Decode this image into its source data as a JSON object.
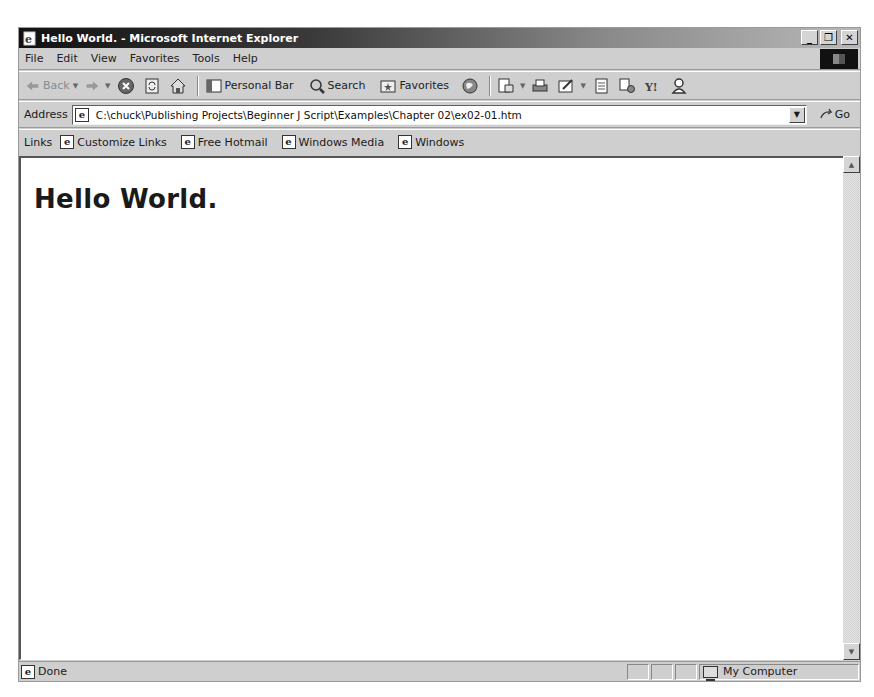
{
  "window": {
    "title": "Hello World. - Microsoft Internet Explorer",
    "controls": {
      "minimize": "_",
      "restore": "❐",
      "close": "✕"
    }
  },
  "menubar": {
    "items": [
      {
        "label": "File",
        "accel": "F"
      },
      {
        "label": "Edit",
        "accel": "E"
      },
      {
        "label": "View",
        "accel": "V"
      },
      {
        "label": "Favorites",
        "accel": "a"
      },
      {
        "label": "Tools",
        "accel": "T"
      },
      {
        "label": "Help",
        "accel": "H"
      }
    ]
  },
  "toolbar": {
    "back_label": "Back",
    "personal_bar_label": "Personal Bar",
    "search_label": "Search",
    "favorites_label": "Favorites",
    "icons": [
      "back-icon",
      "forward-icon",
      "stop-icon",
      "refresh-icon",
      "home-icon",
      "personal-bar-icon",
      "search-icon",
      "favorites-icon",
      "history-icon",
      "mail-icon",
      "print-icon",
      "edit-icon",
      "discuss-icon",
      "messenger-icon",
      "yahoo-icon",
      "user-icon"
    ]
  },
  "address": {
    "label": "Address",
    "value": "C:\\chuck\\Publishing Projects\\Beginner J Script\\Examples\\Chapter 02\\ex02-01.htm",
    "go_label": "Go"
  },
  "links": {
    "label": "Links",
    "items": [
      "Customize Links",
      "Free Hotmail",
      "Windows Media",
      "Windows"
    ]
  },
  "content": {
    "heading": "Hello World."
  },
  "statusbar": {
    "text": "Done",
    "zone": "My Computer"
  }
}
